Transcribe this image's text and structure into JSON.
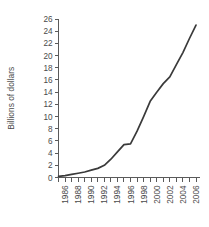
{
  "chart_data": {
    "type": "line",
    "title": "",
    "subtitle": "",
    "xlabel": "",
    "ylabel": "Billions of dollars",
    "x": [
      1985,
      1986,
      1987,
      1988,
      1989,
      1990,
      1991,
      1992,
      1993,
      1994,
      1995,
      1996,
      1997,
      1998,
      1999,
      2000,
      2001,
      2002,
      2003,
      2004,
      2005,
      2006
    ],
    "series": [
      {
        "name": "Billions of dollars",
        "values": [
          0.2,
          0.3,
          0.5,
          0.7,
          0.9,
          1.2,
          1.5,
          2.0,
          3.0,
          4.2,
          5.4,
          5.5,
          7.6,
          10.0,
          12.5,
          14.0,
          15.4,
          16.5,
          18.5,
          20.5,
          22.8,
          25.0
        ]
      }
    ],
    "xlim": [
      1985,
      2006
    ],
    "ylim": [
      0,
      26
    ],
    "ytick_step": 2,
    "yticks": [
      0,
      2,
      4,
      6,
      8,
      10,
      12,
      14,
      16,
      18,
      20,
      22,
      24,
      26
    ],
    "ytick_labels": [
      "0",
      "2",
      "4",
      "6",
      "8",
      "10",
      "12",
      "14",
      "16",
      "18",
      "20",
      "22",
      "24",
      "26"
    ],
    "xtick_labels": [
      "1986",
      "1988",
      "1990",
      "1992",
      "1994",
      "1996",
      "1998",
      "2000",
      "2002",
      "2004",
      "2006"
    ],
    "xtick_label_years": [
      1986,
      1988,
      1990,
      1992,
      1994,
      1996,
      1998,
      2000,
      2002,
      2004,
      2006
    ],
    "xtick_minor_years": [
      1985,
      1986,
      1987,
      1988,
      1989,
      1990,
      1991,
      1992,
      1993,
      1994,
      1995,
      1996,
      1997,
      1998,
      1999,
      2000,
      2001,
      2002,
      2003,
      2004,
      2005,
      2006
    ],
    "grid": false,
    "legend": false,
    "legend_position": "none",
    "line_color": "#3a3a3a",
    "axis_color": "#5a5a5a",
    "text_color": "#4a4a4a",
    "background_color": "#ffffff",
    "xtick_label_rotation": -90
  }
}
